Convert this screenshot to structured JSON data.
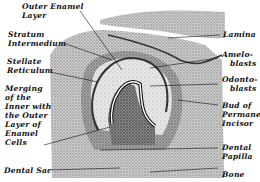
{
  "figure": {
    "labels_left": [
      {
        "id": "outer-enamel-layer",
        "lines": [
          "Outer Enamel",
          "Layer"
        ]
      },
      {
        "id": "stratum-intermedium",
        "lines": [
          "Stratum",
          "Intermedium"
        ]
      },
      {
        "id": "stellate-reticulum",
        "lines": [
          "Stellate",
          "Reticulum"
        ]
      },
      {
        "id": "merging",
        "lines": [
          "Merging",
          "of the",
          "Inner with",
          "the Outer",
          "Layer of",
          "Enamel",
          "Cells"
        ]
      },
      {
        "id": "dental-sac",
        "lines": [
          "Dental Sac"
        ]
      }
    ],
    "labels_right": [
      {
        "id": "lamina",
        "lines": [
          "Lamina"
        ]
      },
      {
        "id": "ameloblasts",
        "lines": [
          "Amelo-",
          "blasts"
        ]
      },
      {
        "id": "odontoblasts",
        "lines": [
          "Odonto-",
          "blasts"
        ]
      },
      {
        "id": "bud-permanent-incisor",
        "lines": [
          "Bud of",
          "Permanent",
          "Incisor"
        ]
      },
      {
        "id": "dental-papilla",
        "lines": [
          "Dental",
          "Papilla"
        ]
      },
      {
        "id": "bone",
        "lines": [
          "Bone"
        ]
      }
    ],
    "colors": {
      "ink": "#111111",
      "tissue_light": "#d9d9d9",
      "tissue_mid": "#a8a8a8",
      "tissue_dark": "#6e6e6e",
      "background": "#ffffff"
    }
  }
}
